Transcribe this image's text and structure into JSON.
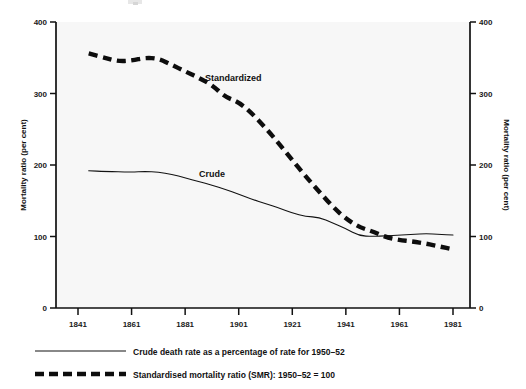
{
  "chart_data": {
    "type": "line",
    "title": "",
    "xlabel": "",
    "ylabel": "Mortality ratio (per cent)",
    "ylabel_right": "Mortality ratio (per cent)",
    "xlim": [
      1841,
      1981
    ],
    "ylim": [
      0,
      400
    ],
    "yticks": [
      0,
      100,
      200,
      300,
      400
    ],
    "ytick_labels": [
      "0",
      "100",
      "200",
      "300",
      "400"
    ],
    "xticks": [
      1841,
      1861,
      1881,
      1901,
      1921,
      1941,
      1961,
      1981
    ],
    "xtick_labels": [
      "1841",
      "1861",
      "1881",
      "1901",
      "1921",
      "1941",
      "1961",
      "1981"
    ],
    "grid": false,
    "legend_position": "below-axes",
    "annotations": [
      {
        "text": "Standardized",
        "x": 1899,
        "y": 318
      },
      {
        "text": "Crude",
        "x": 1891,
        "y": 183
      }
    ],
    "series": [
      {
        "name": "Crude",
        "legend": "Crude death rate as a percentage of rate for 1950–52",
        "style": "solid",
        "x": [
          1845,
          1851,
          1861,
          1866,
          1871,
          1876,
          1881,
          1886,
          1891,
          1896,
          1901,
          1906,
          1911,
          1916,
          1921,
          1926,
          1931,
          1936,
          1941,
          1946,
          1951,
          1956,
          1961,
          1966,
          1971,
          1976,
          1981
        ],
        "values": [
          192,
          191,
          190,
          191,
          190,
          187,
          182,
          177,
          172,
          166,
          159,
          152,
          146,
          140,
          133,
          128,
          127,
          119,
          111,
          101,
          100,
          101,
          102,
          103,
          104,
          103,
          102
        ]
      },
      {
        "name": "Standardized",
        "legend": "Standardised mortality ratio (SMR): 1950–52 = 100",
        "style": "dashed",
        "x": [
          1845,
          1851,
          1856,
          1861,
          1866,
          1871,
          1876,
          1881,
          1886,
          1891,
          1896,
          1901,
          1906,
          1911,
          1916,
          1921,
          1926,
          1931,
          1936,
          1941,
          1946,
          1951,
          1956,
          1961,
          1966,
          1971,
          1976,
          1981
        ],
        "values": [
          356,
          350,
          345,
          346,
          350,
          349,
          340,
          331,
          322,
          312,
          295,
          288,
          272,
          252,
          230,
          207,
          184,
          163,
          142,
          125,
          113,
          107,
          99,
          95,
          93,
          90,
          86,
          82
        ]
      }
    ]
  },
  "axes": {
    "left_title": "Mortality ratio (per cent)",
    "right_title": "Mortality ratio (per cent)"
  },
  "legend": {
    "items": [
      {
        "label": "Crude death rate as a percentage of rate for 1950–52",
        "style": "solid"
      },
      {
        "label": "Standardised mortality ratio (SMR): 1950–52 = 100",
        "style": "dashed"
      }
    ]
  }
}
